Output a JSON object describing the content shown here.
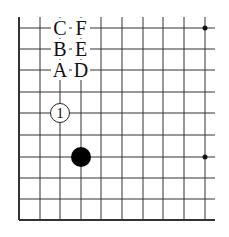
{
  "board": {
    "grid_xs": [
      19,
      40,
      60,
      81,
      101,
      122,
      143,
      163,
      184,
      205
    ],
    "grid_ys": [
      28,
      49,
      70,
      92,
      113,
      135,
      157,
      178,
      199,
      220
    ],
    "right_edge": 215,
    "top_edge": 17,
    "hoshi": [
      {
        "x": 205,
        "y": 28
      },
      {
        "x": 205,
        "y": 157
      }
    ]
  },
  "stones": [
    {
      "color": "white",
      "x": 60,
      "y": 113,
      "label": "1"
    },
    {
      "color": "black",
      "x": 81,
      "y": 157,
      "label": ""
    }
  ],
  "labels": [
    {
      "text": "C",
      "x": 60,
      "y": 28
    },
    {
      "text": "B",
      "x": 60,
      "y": 49
    },
    {
      "text": "A",
      "x": 60,
      "y": 70
    },
    {
      "text": "F",
      "x": 81,
      "y": 28
    },
    {
      "text": "E",
      "x": 81,
      "y": 49
    },
    {
      "text": "D",
      "x": 81,
      "y": 70
    }
  ]
}
